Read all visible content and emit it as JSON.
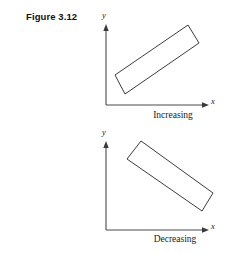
{
  "figure": {
    "label": "Figure 3.12",
    "background_color": "#ffffff",
    "line_color": "#3a3a3a",
    "stroke_color": "#262626"
  },
  "panels": [
    {
      "id": "increasing",
      "caption": "Increasing",
      "y_axis_label": "y",
      "x_axis_label": "x",
      "origin": [
        106,
        105
      ],
      "y_axis_tip": [
        106,
        26
      ],
      "x_axis_tip": [
        209,
        105
      ],
      "scatter_ellipse_corners": [
        [
          188,
          25
        ],
        [
          199,
          43
        ],
        [
          125,
          94
        ],
        [
          115,
          75
        ]
      ],
      "direction": "positive-slope"
    },
    {
      "id": "decreasing",
      "caption": "Decreasing",
      "y_axis_label": "y",
      "x_axis_label": "x",
      "origin": [
        106,
        230
      ],
      "y_axis_tip": [
        106,
        143
      ],
      "x_axis_tip": [
        209,
        230
      ],
      "scatter_ellipse_corners": [
        [
          141,
          141
        ],
        [
          213,
          193
        ],
        [
          202,
          211
        ],
        [
          127,
          159
        ]
      ],
      "direction": "negative-slope"
    }
  ]
}
